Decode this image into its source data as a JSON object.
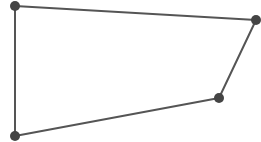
{
  "diagram": {
    "type": "quadrilateral",
    "stroke_color": "#555555",
    "vertex_color": "#444444",
    "stroke_width": 2,
    "vertex_radius": 5,
    "vertices": [
      {
        "id": "A",
        "x": 15,
        "y": 6
      },
      {
        "id": "B",
        "x": 256,
        "y": 20
      },
      {
        "id": "C",
        "x": 219,
        "y": 98
      },
      {
        "id": "D",
        "x": 15,
        "y": 136
      }
    ]
  }
}
